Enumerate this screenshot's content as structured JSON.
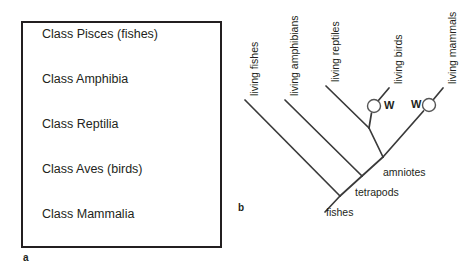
{
  "figure": {
    "panel_a": {
      "caption": "a",
      "classes": [
        {
          "label": "Class Pisces (fishes)"
        },
        {
          "label": "Class Amphibia"
        },
        {
          "label": "Class Reptilia"
        },
        {
          "label": "Class Aves (birds)"
        },
        {
          "label": "Class Mammalia"
        }
      ]
    },
    "panel_b": {
      "caption": "b",
      "tips": [
        {
          "label": "living fishes"
        },
        {
          "label": "living amphibians"
        },
        {
          "label": "living reptiles"
        },
        {
          "label": "living birds"
        },
        {
          "label": "living mammals"
        }
      ],
      "nodes": [
        {
          "label": "fishes"
        },
        {
          "label": "tetrapods"
        },
        {
          "label": "amniotes"
        }
      ],
      "markers": [
        {
          "label": "W"
        },
        {
          "label": "W"
        }
      ]
    }
  },
  "colors": {
    "ink": "#231f20",
    "line": "#3a3a3a",
    "marker_stroke": "#555555",
    "marker_fill": "#ffffff",
    "background": "#ffffff"
  }
}
